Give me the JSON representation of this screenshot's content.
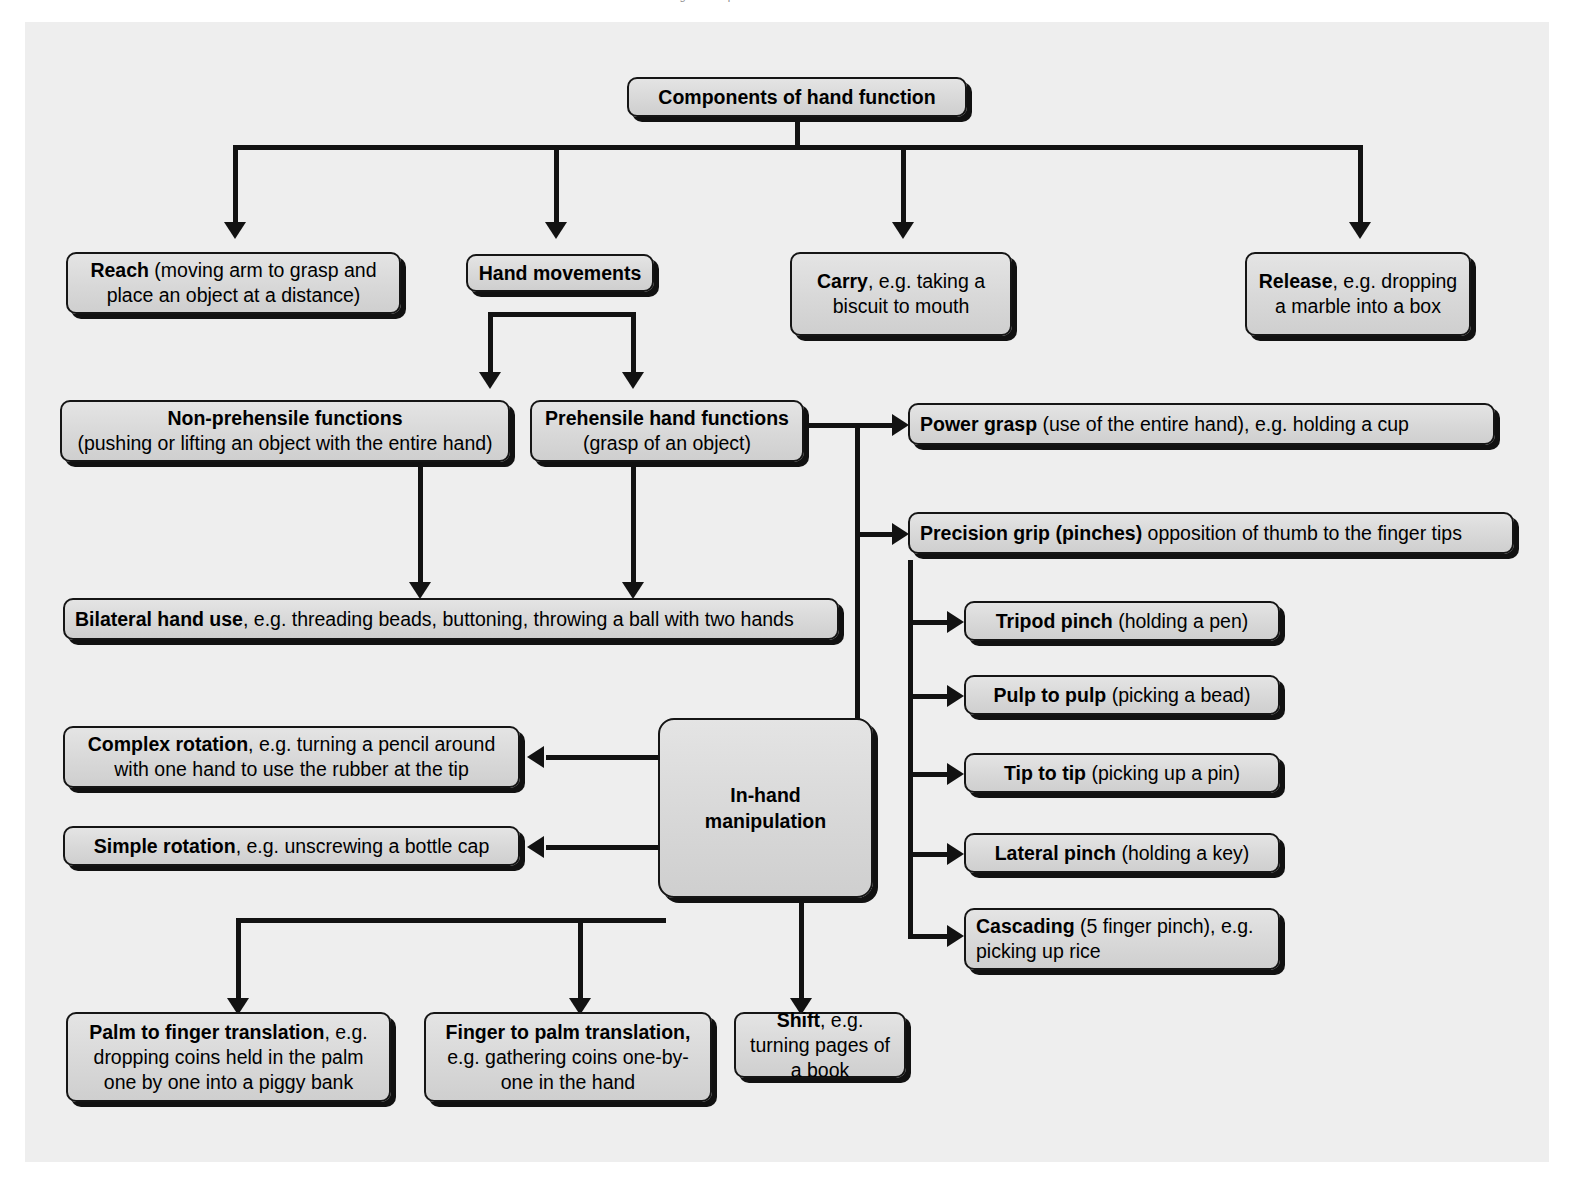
{
  "page": {
    "cut_off_caption": "Figure   Components of hand function   hand skills",
    "background_color": "#eeeeee",
    "box_fill": "#d8d8d8",
    "line_color": "#121212"
  },
  "nodes": {
    "title": {
      "bold": "Components of hand function",
      "rest": ""
    },
    "reach": {
      "bold": "Reach",
      "rest": " (moving arm to grasp and place an object at a distance)"
    },
    "hand_movements": {
      "bold": "Hand movements",
      "rest": ""
    },
    "carry": {
      "bold": "Carry",
      "rest": ", e.g. taking a biscuit to mouth"
    },
    "release": {
      "bold": "Release",
      "rest": ", e.g. dropping a marble into a box"
    },
    "non_prehensile": {
      "bold": "Non-prehensile functions",
      "rest": "(pushing or lifting an object with the entire hand)"
    },
    "prehensile": {
      "bold": "Prehensile hand functions",
      "rest": "(grasp of an object)"
    },
    "power_grasp": {
      "bold": "Power grasp",
      "rest": " (use of the entire hand), e.g. holding a cup"
    },
    "precision_grip": {
      "bold": "Precision grip (pinches)",
      "rest": " opposition of thumb to the finger tips"
    },
    "bilateral": {
      "bold": "Bilateral hand use",
      "rest": ", e.g. threading beads, buttoning, throwing a ball with two hands"
    },
    "tripod_pinch": {
      "bold": "Tripod pinch",
      "rest": " (holding a pen)"
    },
    "pulp_to_pulp": {
      "bold": "Pulp to pulp",
      "rest": " (picking a bead)"
    },
    "tip_to_tip": {
      "bold": "Tip to tip",
      "rest": " (picking up a pin)"
    },
    "lateral_pinch": {
      "bold": "Lateral pinch",
      "rest": " (holding a key)"
    },
    "cascading": {
      "bold": "Cascading",
      "rest": " (5 finger pinch), e.g. picking up rice"
    },
    "complex_rotation": {
      "bold": "Complex rotation",
      "rest": ", e.g. turning a pencil around with one hand to use the rubber at the tip"
    },
    "simple_rotation": {
      "bold": "Simple rotation",
      "rest": ", e.g. unscrewing a bottle cap"
    },
    "in_hand": {
      "bold": "In-hand manipulation",
      "rest": ""
    },
    "palm_to_finger": {
      "bold": "Palm to finger translation",
      "rest": ", e.g. dropping coins held in the palm one by one into a piggy bank"
    },
    "finger_to_palm": {
      "bold": "Finger to palm translation,",
      "rest": " e.g. gathering coins one-by-one in the hand"
    },
    "shift": {
      "bold": "Shift",
      "rest": ", e.g. turning pages of a book"
    }
  },
  "diagram_data": {
    "type": "hierarchy-flowchart",
    "root": "Components of hand function",
    "branches": [
      "Reach (moving arm to grasp and place an object at a distance)",
      "Hand movements",
      "Carry, e.g. taking a biscuit to mouth",
      "Release, e.g. dropping a marble into a box"
    ],
    "hand_movements_children": [
      "Non-prehensile functions (pushing or lifting an object with the entire hand)",
      "Prehensile hand functions (grasp of an object)"
    ],
    "non_prehensile_children": [
      "Bilateral hand use"
    ],
    "prehensile_children": [
      "Power grasp (use of the entire hand), e.g. holding a cup",
      "Precision grip (pinches) opposition of thumb to the finger tips",
      "In-hand manipulation",
      "Bilateral hand use"
    ],
    "precision_grip_children": [
      "Tripod pinch (holding a pen)",
      "Pulp to pulp (picking a bead)",
      "Tip to tip (picking up a pin)",
      "Lateral pinch (holding a key)",
      "Cascading (5 finger pinch), e.g. picking up rice"
    ],
    "in_hand_children": [
      "Complex rotation, e.g. turning a pencil around with one hand to use the rubber at the tip",
      "Simple rotation, e.g. unscrewing a bottle cap",
      "Palm to finger translation, e.g. dropping coins held in the palm one by one into a piggy bank",
      "Finger to palm translation, e.g. gathering coins one-by-one in the hand",
      "Shift, e.g. turning pages of a book"
    ]
  }
}
